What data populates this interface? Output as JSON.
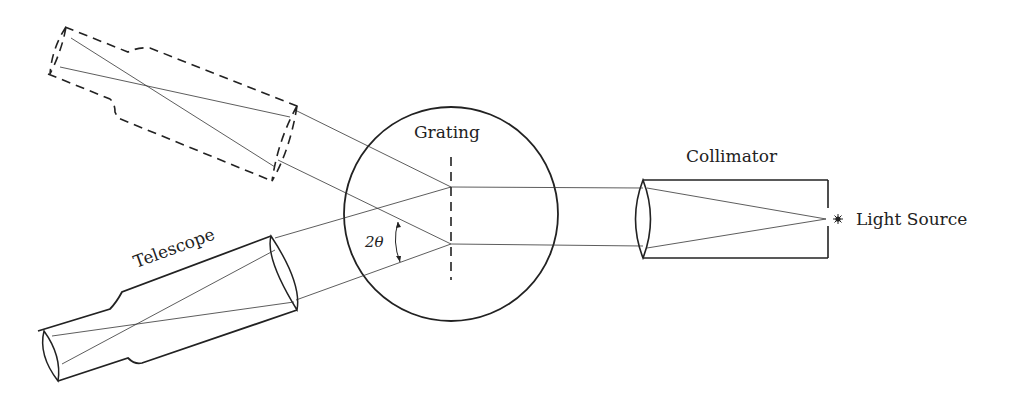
{
  "diagram": {
    "labels": {
      "grating": "Grating",
      "collimator": "Collimator",
      "light_source": "Light Source",
      "telescope": "Telescope",
      "angle": "2θ"
    },
    "colors": {
      "ink": "#222222",
      "background": "#ffffff"
    },
    "components": [
      {
        "name": "Light Source",
        "style": "star point"
      },
      {
        "name": "Collimator",
        "style": "solid rectangle with lens"
      },
      {
        "name": "Grating",
        "style": "dashed vertical line inside circle"
      },
      {
        "name": "Telescope",
        "style": "solid tube (lower position)"
      },
      {
        "name": "Telescope",
        "style": "dashed tube (alternate upper position)"
      }
    ]
  }
}
